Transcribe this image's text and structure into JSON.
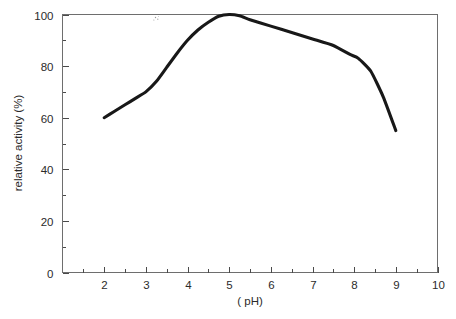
{
  "chart_data": {
    "type": "line",
    "title": "",
    "subtitle": "",
    "xlabel": "( pH)",
    "ylabel": "relative activity (%)",
    "xlim": [
      1,
      10
    ],
    "ylim": [
      0,
      100
    ],
    "grid": false,
    "legend": null,
    "legend_position": "none",
    "x_tick_labels": [
      "2",
      "3",
      "4",
      "5",
      "6",
      "7",
      "8",
      "9",
      "10"
    ],
    "x_ticks": [
      2,
      3,
      4,
      5,
      6,
      7,
      8,
      9,
      10
    ],
    "x_minor_ticks": [
      1.5,
      2.5,
      3.5,
      4.5,
      5.5,
      6.5,
      7.5,
      8.5,
      9.5
    ],
    "y_tick_labels": [
      "0",
      "20",
      "40",
      "60",
      "80",
      "100"
    ],
    "y_ticks": [
      0,
      20,
      40,
      60,
      80,
      100
    ],
    "y_minor_ticks": [
      10,
      30,
      50,
      70,
      90
    ],
    "series": [
      {
        "name": "relative activity",
        "color": "#181818",
        "x": [
          2.0,
          2.25,
          2.5,
          2.75,
          3.0,
          3.25,
          3.5,
          3.75,
          4.0,
          4.25,
          4.5,
          4.75,
          5.0,
          5.25,
          5.5,
          6.0,
          6.5,
          7.0,
          7.5,
          7.9,
          8.1,
          8.4,
          8.7,
          9.0
        ],
        "values": [
          60,
          62.5,
          65,
          67.5,
          70,
          74,
          79.5,
          85,
          90,
          94,
          97,
          99.3,
          100,
          99.5,
          98,
          95.5,
          93,
          90.5,
          88,
          84.5,
          83,
          78,
          68,
          55
        ]
      }
    ],
    "annotations": []
  },
  "figure": {
    "background_color": "#ffffff",
    "frame_color": "#6e6e6e",
    "axis_text_color": "#2b2b2b",
    "curve_color": "#181818",
    "speckle_label": "scan-artifact"
  }
}
